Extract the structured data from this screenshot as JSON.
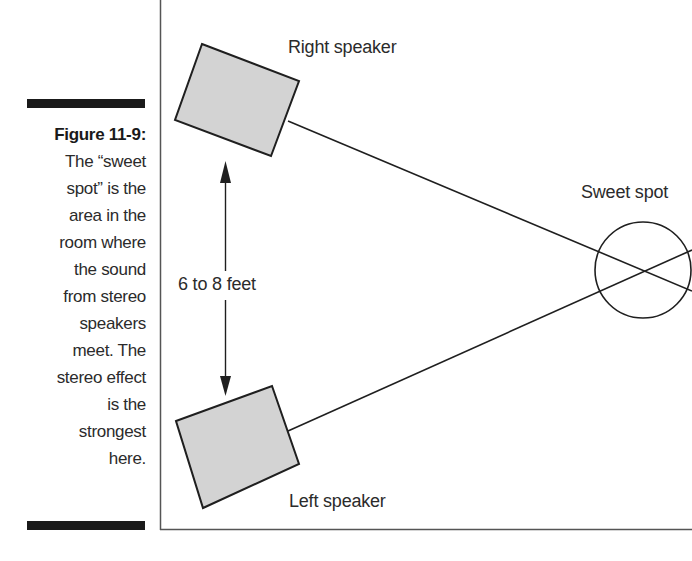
{
  "caption": {
    "figure_label": "Figure 11-9:",
    "lines": [
      "The “sweet",
      "spot” is the",
      "area in the",
      "room where",
      "the sound",
      "from stereo",
      "speakers",
      "meet.  The",
      "stereo effect",
      "is the",
      "strongest",
      "here."
    ]
  },
  "diagram": {
    "labels": {
      "right_speaker": "Right speaker",
      "left_speaker": "Left speaker",
      "sweet_spot": "Sweet spot",
      "distance": "6 to 8 feet"
    },
    "colors": {
      "speaker_fill": "#d3d3d3",
      "stroke": "#1f1f1f",
      "frame": "#555555",
      "rule": "#1a1a1a"
    }
  }
}
